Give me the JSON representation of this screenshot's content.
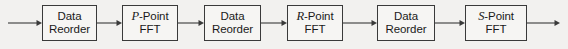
{
  "diagram": {
    "type": "block-flow",
    "orientation": "left-to-right",
    "background_color": "#f2f1ef",
    "line_color": "#3a3a3a",
    "box_fill_color": "#f6f5f3",
    "text_color": "#1a1a1a",
    "nodes": [
      {
        "id": "data-reorder-1",
        "kind": "process",
        "line1": "Data",
        "line2": "Reorder",
        "symbol": "",
        "symbol_italic": false,
        "x": 42,
        "y": 5,
        "w": 55,
        "h": 36
      },
      {
        "id": "p-point-fft",
        "kind": "process",
        "line1": "-Point",
        "line2": "FFT",
        "symbol": "P",
        "symbol_italic": true,
        "x": 122,
        "y": 5,
        "w": 56,
        "h": 36
      },
      {
        "id": "data-reorder-2",
        "kind": "process",
        "line1": "Data",
        "line2": "Reorder",
        "symbol": "",
        "symbol_italic": false,
        "x": 204,
        "y": 5,
        "w": 57,
        "h": 36
      },
      {
        "id": "r-point-fft",
        "kind": "process",
        "line1": "-Point",
        "line2": "FFT",
        "symbol": "R",
        "symbol_italic": true,
        "x": 287,
        "y": 5,
        "w": 56,
        "h": 36
      },
      {
        "id": "data-reorder-3",
        "kind": "process",
        "line1": "Data",
        "line2": "Reorder",
        "symbol": "",
        "symbol_italic": false,
        "x": 377,
        "y": 5,
        "w": 58,
        "h": 36
      },
      {
        "id": "s-point-fft",
        "kind": "process",
        "line1": "-Point",
        "line2": "FFT",
        "symbol": "S",
        "symbol_italic": true,
        "x": 465,
        "y": 5,
        "w": 62,
        "h": 36
      }
    ],
    "connectors": [
      {
        "id": "input-arrow",
        "from": "",
        "to": "data-reorder-1",
        "x1": 8,
        "x2": 42,
        "y": 23
      },
      {
        "id": "conn-1",
        "from": "data-reorder-1",
        "to": "p-point-fft",
        "x1": 97,
        "x2": 122,
        "y": 23
      },
      {
        "id": "conn-2",
        "from": "p-point-fft",
        "to": "data-reorder-2",
        "x1": 178,
        "x2": 204,
        "y": 23
      },
      {
        "id": "conn-3",
        "from": "data-reorder-2",
        "to": "r-point-fft",
        "x1": 261,
        "x2": 287,
        "y": 23
      },
      {
        "id": "conn-4",
        "from": "r-point-fft",
        "to": "data-reorder-3",
        "x1": 343,
        "x2": 377,
        "y": 23
      },
      {
        "id": "conn-5",
        "from": "data-reorder-3",
        "to": "s-point-fft",
        "x1": 435,
        "x2": 465,
        "y": 23
      },
      {
        "id": "output-arrow",
        "from": "s-point-fft",
        "to": "",
        "x1": 527,
        "x2": 560,
        "y": 23
      }
    ]
  }
}
